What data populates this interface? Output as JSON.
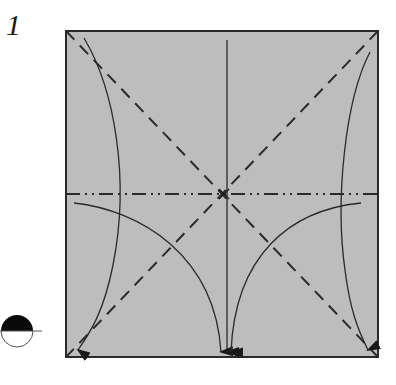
{
  "step": {
    "number": "1"
  },
  "colors": {
    "paper_fill": "#bdbdbd",
    "line": "#2a2a2a",
    "background": "#ffffff"
  },
  "diagram": {
    "square": {
      "x": 66,
      "y": 31,
      "size": 312
    },
    "creases": [
      {
        "type": "valley",
        "from": "top-left",
        "to": "bottom-right"
      },
      {
        "type": "valley",
        "from": "top-right",
        "to": "bottom-left"
      },
      {
        "type": "mountain",
        "orientation": "horizontal",
        "position": "middle"
      }
    ],
    "arrows": [
      {
        "from": "top-left corner",
        "to": "bottom-left corner"
      },
      {
        "from": "top-right corner",
        "to": "bottom-right corner"
      },
      {
        "from": "top-center",
        "to": "bottom-center"
      },
      {
        "from": "left-middle edge",
        "to": "bottom-center"
      },
      {
        "from": "right-middle edge",
        "to": "bottom-center"
      }
    ],
    "view_symbol": "half-black circle (turn over / view side)"
  }
}
